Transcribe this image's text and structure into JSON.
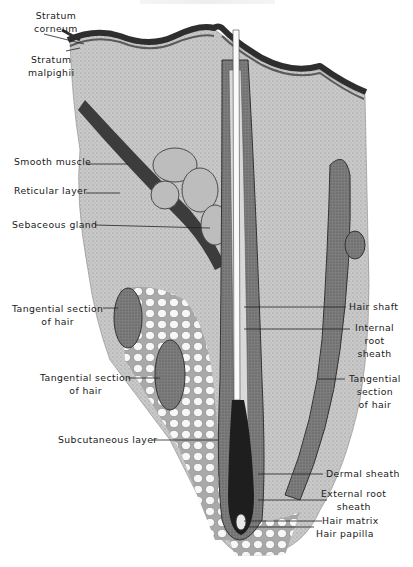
{
  "figure": {
    "style": "grayscale histology illustration"
  },
  "labels": {
    "left": [
      {
        "id": "stratum-corneum",
        "line1": "Stratum",
        "line2": "corneum"
      },
      {
        "id": "stratum-malpighii",
        "line1": "Stratum",
        "line2": "malpighii"
      },
      {
        "id": "smooth-muscle",
        "line1": "Smooth muscle"
      },
      {
        "id": "reticular-layer",
        "line1": "Reticular layer"
      },
      {
        "id": "sebaceous-gland",
        "line1": "Sebaceous gland"
      },
      {
        "id": "tangential-section-1",
        "line1": "Tangential section",
        "line2": "of hair"
      },
      {
        "id": "tangential-section-2",
        "line1": "Tangential section",
        "line2": "of hair"
      },
      {
        "id": "subcutaneous-layer",
        "line1": "Subcutaneous layer"
      }
    ],
    "right": [
      {
        "id": "hair-shaft",
        "line1": "Hair shaft"
      },
      {
        "id": "internal-root-sheath",
        "line1": "Internal",
        "line2": "root",
        "line3": "sheath"
      },
      {
        "id": "tangential-section-3",
        "line1": "Tangential",
        "line2": "section",
        "line3": "of hair"
      },
      {
        "id": "dermal-sheath",
        "line1": "Dermal sheath"
      },
      {
        "id": "external-root-sheath",
        "line1": "External root",
        "line2": "sheath"
      },
      {
        "id": "hair-matrix",
        "line1": "Hair matrix"
      },
      {
        "id": "hair-papilla",
        "line1": "Hair papilla"
      }
    ]
  },
  "colors": {
    "tissue_light": "#cfcfcf",
    "tissue_mid": "#9a9a9a",
    "tissue_dark": "#3a3a3a",
    "epidermis": "#2e2e2e",
    "label_text": "#1a1a1a"
  }
}
